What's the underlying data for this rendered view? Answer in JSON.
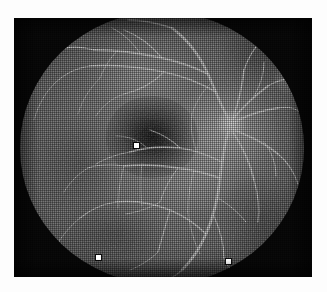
{
  "image": {
    "kind": "fundus-fluorescein-angiogram",
    "modality_label": "Fluorescein angiogram, posterior pole",
    "eye": "right",
    "color_mode": "grayscale",
    "reproduction": "halftone print scan",
    "canvas": {
      "width": 327,
      "height": 292,
      "background": "#fdfdfd"
    },
    "plate": {
      "x": 14,
      "y": 18,
      "width": 298,
      "height": 259,
      "background": "#0a0a0a"
    }
  },
  "colors": {
    "paper": "#fdfdfd",
    "plate_black": "#0a0a0a",
    "retina_mid": "#7d7d7d",
    "retina_bright": "#bebebe",
    "vessel": "#d8d8d8",
    "macula_dark": "#000000",
    "marker_fill": "#ffffff",
    "marker_outline": "#000000"
  },
  "field": {
    "name": "circular-retinal-field",
    "center_x": 148,
    "center_y": 130,
    "radius_x": 142,
    "radius_y": 136,
    "notch": {
      "name": "superior-temporal-boundary-notch",
      "x": 256,
      "y": 44
    }
  },
  "anatomy": [
    {
      "name": "macula",
      "label": "Macula / fovea",
      "center_x": 132,
      "center_y": 125,
      "width": 92,
      "height": 82,
      "appearance": "hypofluorescent dark zone"
    },
    {
      "name": "optic-disc",
      "label": "Optic disc",
      "center_x": 211,
      "center_y": 113,
      "diameter": 30,
      "appearance": "hyperfluorescent bright disc"
    },
    {
      "name": "superior-temporal-arcade",
      "label": "Superior temporal arcade"
    },
    {
      "name": "inferior-temporal-arcade",
      "label": "Inferior temporal arcade"
    }
  ],
  "markers": [
    {
      "name": "marker-fovea",
      "label": "Fovea fiducial marker",
      "x": 134,
      "y": 143,
      "size": 5
    },
    {
      "name": "marker-inferior-left",
      "label": "Inferior left fiducial marker",
      "x": 96,
      "y": 255,
      "size": 5
    },
    {
      "name": "marker-inferior-right",
      "label": "Inferior right fiducial marker",
      "x": 226,
      "y": 259,
      "size": 5
    }
  ],
  "caption": {
    "text": ""
  }
}
